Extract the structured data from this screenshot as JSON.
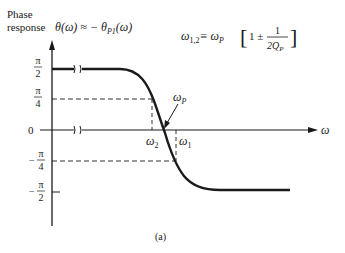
{
  "figure": {
    "ylabel_line1": "Phase",
    "ylabel_line2": "response",
    "curve_label": "θ(ω) ≈ − θ",
    "curve_label_sub": "P1",
    "curve_label_arg": "(ω)",
    "formula_lhs": "ω",
    "formula_lhs_sub": "1,2",
    "formula_eq": "≡ ω",
    "formula_eq_sub": "P",
    "formula_bracket_open": "[",
    "formula_one_pm": "1 ±",
    "formula_num": "1",
    "formula_den": "2Q",
    "formula_den_sub": "P",
    "formula_bracket_close": "]",
    "omega_p": "ω",
    "omega_p_sub": "P",
    "omega_1": "ω",
    "omega_1_sub": "1",
    "omega_2": "ω",
    "omega_2_sub": "2",
    "x_axis_label": "ω",
    "caption": "(a)",
    "y_ticks": [
      {
        "sign": "",
        "num": "π",
        "den": "2"
      },
      {
        "sign": "",
        "num": "π",
        "den": "4"
      },
      {
        "sign": "",
        "num": "0",
        "den": ""
      },
      {
        "sign": "−",
        "num": "π",
        "den": "4"
      },
      {
        "sign": "−",
        "num": "π",
        "den": "2"
      }
    ],
    "line_color": "#1a1a1a"
  }
}
